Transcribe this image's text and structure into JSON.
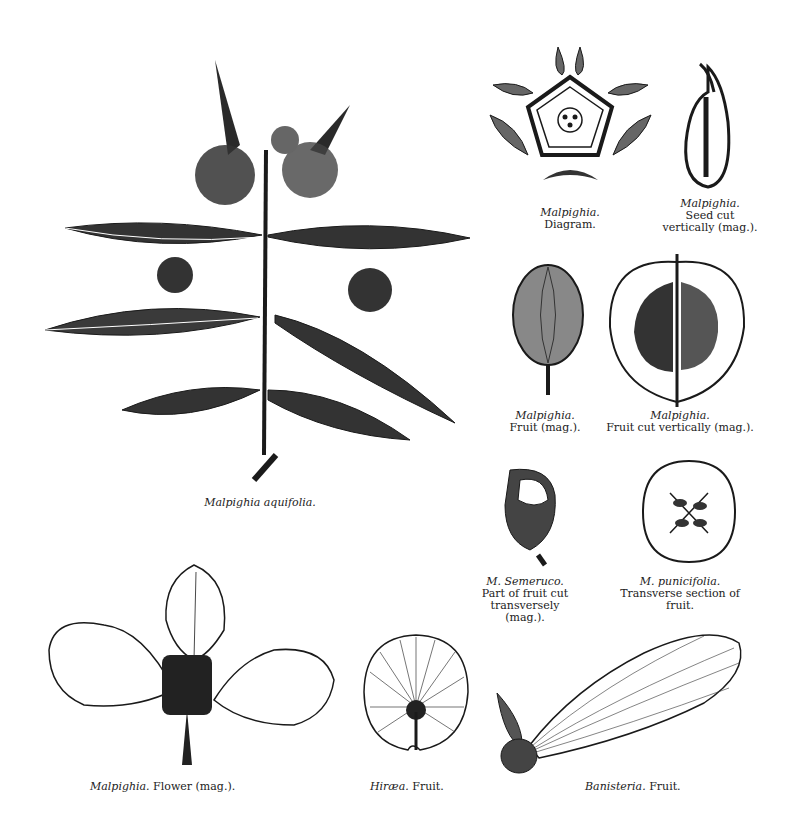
{
  "plate": {
    "figures": [
      {
        "id": "aquifolia",
        "species": "Malpighia aquifolia.",
        "caption": ""
      },
      {
        "id": "diagram",
        "species": "Malpighia.",
        "caption": "Diagram."
      },
      {
        "id": "seed",
        "species": "Malpighia.",
        "caption_lines": [
          "Seed cut",
          "vertically (mag.)."
        ]
      },
      {
        "id": "fruit",
        "species": "Malpighia.",
        "caption": "Fruit (mag.)."
      },
      {
        "id": "fruit-cut",
        "species": "Malpighia.",
        "caption": "Fruit cut vertically (mag.)."
      },
      {
        "id": "semeruco",
        "species": "M. Semeruco.",
        "caption_lines": [
          "Part of fruit cut",
          "transversely (mag.)."
        ]
      },
      {
        "id": "punicifolia",
        "species": "M. punicifolia.",
        "caption_lines": [
          "Transverse section of",
          "fruit."
        ]
      },
      {
        "id": "flower",
        "species": "Malpighia.",
        "caption": "Flower (mag.)."
      },
      {
        "id": "hiraea",
        "species": "Hiræa.",
        "caption": "Fruit."
      },
      {
        "id": "banisteria",
        "species": "Banisteria.",
        "caption": "Fruit."
      }
    ]
  },
  "colors": {
    "ink": "#1a1a1a",
    "paper": "#ffffff",
    "shade": "#555555"
  }
}
